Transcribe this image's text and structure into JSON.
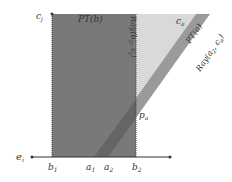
{
  "diagram": {
    "labels": {
      "c_j": "c",
      "c_j_sub": "j",
      "c_a": "c",
      "c_a_sub": "a",
      "pt_b": "PT(b)",
      "pt_a": "PT(a)",
      "ray_b2": "Ray(b",
      "ray_b2_sub": "2",
      "ray_b2_tail": ", c",
      "ray_b2_sub2": "j",
      "ray_b2_end": ")",
      "ray_a2": "Ray(a",
      "ray_a2_sub": "2",
      "ray_a2_mid": ", c",
      "ray_a2_sub2": "a",
      "ray_a2_end": ")",
      "p_a": "p",
      "p_a_sub": "a",
      "e_i": "e",
      "e_i_sub": "i",
      "b1": "b",
      "b1_sub": "1",
      "a1": "a",
      "a1_sub": "1",
      "a2": "a",
      "a2_sub": "2",
      "b2": "b",
      "b2_sub": "2"
    },
    "colors": {
      "pt_b_fill": "#6e6e6e",
      "pt_a_fill": "#d9d9d9",
      "ray_band_fill": "#9a9a9a",
      "line": "#333333"
    }
  }
}
